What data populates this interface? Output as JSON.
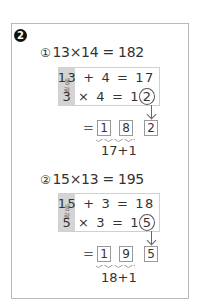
{
  "badge": "2",
  "problems": [
    {
      "marker": "①",
      "equation": "13×14 = 182",
      "strip_label": [
        "생",
        "략"
      ],
      "line1": "13 + 4 = 17",
      "line2_prefix": "3 × 4 = 1",
      "line2_circled": "2",
      "equals": "=",
      "digits": [
        "1",
        "8",
        "2"
      ],
      "sum": "17+1"
    },
    {
      "marker": "②",
      "equation": "15×13 = 195",
      "strip_label": [
        "생",
        "략"
      ],
      "line1": "15 + 3 = 18",
      "line2_prefix": "5 × 3 = 1",
      "line2_circled": "5",
      "equals": "=",
      "digits": [
        "1",
        "9",
        "5"
      ],
      "sum": "18+1"
    }
  ],
  "colors": {
    "frame_border": "#b9b9b9",
    "strip_bg": "#d4d4d4",
    "text": "#333333",
    "badge_bg": "#111111"
  }
}
